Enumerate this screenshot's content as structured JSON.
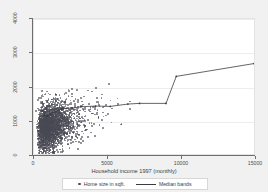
{
  "chart_data": {
    "type": "scatter",
    "title": "",
    "xlabel": "Household income 1997 (monthly)",
    "ylabel": "",
    "xlim": [
      0,
      15000
    ],
    "ylim": [
      0,
      4000
    ],
    "xticks": [
      0,
      5000,
      10000,
      15000
    ],
    "xtick_labels": [
      "0",
      "5000",
      "10000",
      "15000"
    ],
    "yticks": [
      0,
      1000,
      2000,
      3000,
      4000
    ],
    "ytick_labels": [
      "0",
      "1000",
      "2000",
      "3000",
      "4000"
    ],
    "grid": "horizontal",
    "legend_position": "bottom",
    "legend": [
      {
        "name": "Home size in sqft.",
        "marker": "circle"
      },
      {
        "name": "Median bands",
        "marker": "line"
      }
    ],
    "series": [
      {
        "name": "Home size in sqft.",
        "type": "scatter",
        "marker": "circle",
        "color": "#4a4a55",
        "n_points_approx": 2600,
        "description": "Dense cloud of households concentrated between income 0-3500 and home size 100-2200 sqft, thinning rightward with scattered outliers up to 4000 sqft."
      },
      {
        "name": "Median bands",
        "type": "line",
        "color": "#3b3b44",
        "x": [
          700,
          900,
          1100,
          1300,
          1500,
          1700,
          1900,
          2200,
          2600,
          3200,
          4200,
          5200,
          6400,
          7200,
          9000,
          9700,
          15000
        ],
        "y": [
          1150,
          1120,
          1180,
          1230,
          1260,
          1300,
          1340,
          1350,
          1360,
          1400,
          1420,
          1410,
          1480,
          1500,
          1500,
          2300,
          2680
        ]
      }
    ]
  },
  "axis": {
    "x_title": "Household income 1997 (monthly)"
  },
  "legend": {
    "scatter_label": "Home size in sqft.",
    "line_label": "Median bands"
  },
  "colors": {
    "marker": "#4a4a55",
    "line": "#3b3b44",
    "grid": "#ededed",
    "plot_background": "#ffffff",
    "figure_background": "#f1f1f1",
    "axis": "#6f6f6f"
  }
}
